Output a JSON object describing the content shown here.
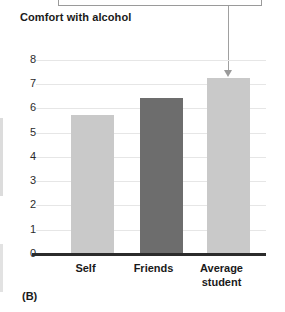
{
  "panel": {
    "label": "(B)"
  },
  "callout": {
    "text": "",
    "arrow_target": "Average student"
  },
  "chart_data": {
    "type": "bar",
    "title": "",
    "ylabel": "Comfort with alcohol",
    "xlabel": "",
    "categories": [
      "Self",
      "Friends",
      "Average student"
    ],
    "values": [
      5.73,
      6.43,
      7.26
    ],
    "ylim": [
      0,
      8
    ],
    "yticks": [
      0,
      1,
      2,
      3,
      4,
      5,
      6,
      7,
      8
    ],
    "ytick_labels": [
      "0",
      "1",
      "2",
      "3",
      "4",
      "5",
      "6",
      "7",
      "8"
    ],
    "grid": true,
    "legend": "none",
    "series": [
      {
        "name": "Comfort with alcohol",
        "values": [
          5.73,
          6.43,
          7.26
        ],
        "colors": [
          "#c9c9c9",
          "#6d6d6d",
          "#c9c9c9"
        ]
      }
    ],
    "colors": {
      "bar_light": "#c9c9c9",
      "bar_dark": "#6d6d6d",
      "axis": "#2b2b2b",
      "gridline": "#e6e6e6",
      "text": "#1a1a1a"
    }
  }
}
